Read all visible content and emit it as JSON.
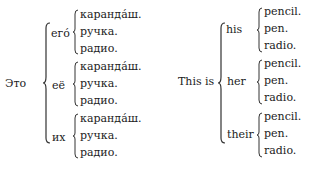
{
  "russian": {
    "lead": "Это",
    "groups": [
      {
        "pronoun": "его́",
        "items": [
          "каранда́ш.",
          "ручка.",
          "радио."
        ]
      },
      {
        "pronoun": "её",
        "items": [
          "каранда́ш.",
          "ручка.",
          "радио."
        ]
      },
      {
        "pronoun": "их",
        "items": [
          "каранда́ш.",
          "ручка.",
          "радио."
        ]
      }
    ]
  },
  "english": {
    "lead": "This is",
    "groups": [
      {
        "pronoun": "his",
        "items": [
          "pencil.",
          "pen.",
          "radio."
        ]
      },
      {
        "pronoun": "her",
        "items": [
          "pencil.",
          "pen.",
          "radio."
        ]
      },
      {
        "pronoun": "their",
        "items": [
          "pencil.",
          "pen.",
          "radio."
        ]
      }
    ]
  }
}
